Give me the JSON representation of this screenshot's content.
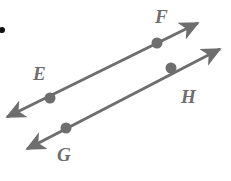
{
  "figure": {
    "kind": "geometry-diagram",
    "background_color": "#ffffff",
    "stroke_color": "#6e6e6e",
    "point_color": "#6e6e6e",
    "bullet_color": "#111111",
    "stroke_width": 3,
    "point_radius": 5.5,
    "canvas": {
      "width": 231,
      "height": 181
    },
    "bullet": {
      "name": "list-bullet",
      "cx": 2,
      "cy": 30,
      "r": 3
    },
    "lines": [
      {
        "id": "line-EF",
        "name": "line-ef",
        "label": "EF",
        "start": {
          "x": 7,
          "y": 117
        },
        "end": {
          "x": 198,
          "y": 23
        },
        "arrow_start": true,
        "arrow_end": true
      },
      {
        "id": "line-GH",
        "name": "line-gh",
        "label": "GH",
        "start": {
          "x": 27,
          "y": 149
        },
        "end": {
          "x": 220,
          "y": 49
        },
        "arrow_start": true,
        "arrow_end": true
      }
    ],
    "points": [
      {
        "id": "E",
        "label": "E",
        "x": 50,
        "y": 98,
        "line": "line-EF",
        "label_x": 33,
        "label_y": 64
      },
      {
        "id": "F",
        "label": "F",
        "x": 157,
        "y": 43,
        "line": "line-EF",
        "label_x": 155,
        "label_y": 7
      },
      {
        "id": "G",
        "label": "G",
        "x": 66,
        "y": 128,
        "line": "line-GH",
        "label_x": 57,
        "label_y": 145
      },
      {
        "id": "H",
        "label": "H",
        "x": 171,
        "y": 68,
        "line": "line-GH",
        "label_x": 181,
        "label_y": 87
      }
    ]
  }
}
